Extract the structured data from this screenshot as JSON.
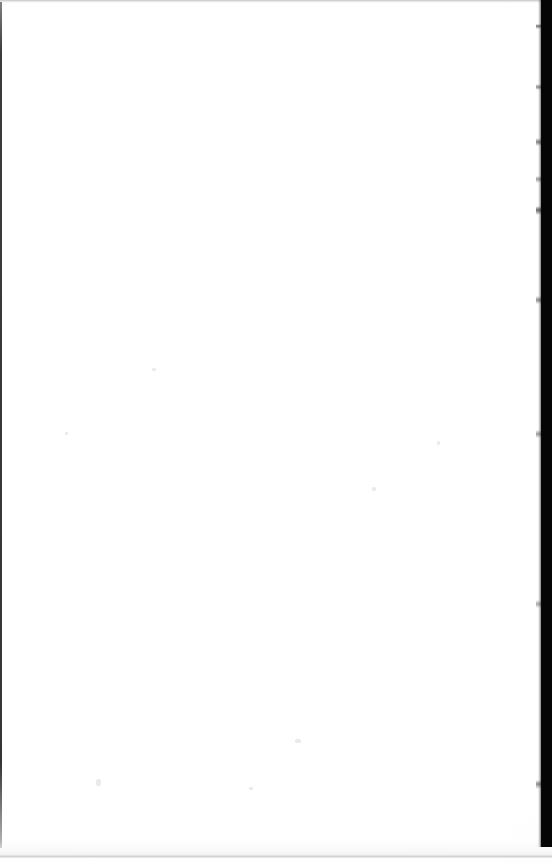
{
  "document": {
    "kind": "scanned-page",
    "page_content_text": "",
    "is_blank": true,
    "width_px": 552,
    "height_px": 863
  },
  "colors": {
    "page_background": "#fefefe",
    "scanner_bed": "#050505",
    "left_edge_line": "#191919",
    "top_edge_line": "#969696",
    "bottom_rule": "#a8a8a8",
    "speckle": "#e1e1e1"
  },
  "regions": {
    "page_surface": {
      "label": "page-surface",
      "x": 0,
      "y": 0,
      "width": 552,
      "height": 863
    },
    "content_area": {
      "label": "content-area",
      "x": 26,
      "y": 30,
      "width": 492,
      "height": 797
    },
    "scanner_bed_right": {
      "label": "scanner-bed-right-strip",
      "x": 541,
      "y": 0,
      "width": 11,
      "height": 847
    },
    "left_edge": {
      "label": "page-edge-left",
      "x": 0,
      "y": 2,
      "width": 2,
      "height": 846
    },
    "top_edge": {
      "label": "page-edge-top",
      "x": 0,
      "y": 0,
      "width": 552,
      "height": 3
    },
    "bottom_rule": {
      "label": "page-edge-bottom",
      "x": 0,
      "y": 855,
      "width": 552,
      "height": 3
    }
  },
  "speckles": [
    {
      "x": 96,
      "y": 779,
      "w": 5,
      "h": 7
    },
    {
      "x": 295,
      "y": 739,
      "w": 6,
      "h": 4
    },
    {
      "x": 249,
      "y": 787,
      "w": 4,
      "h": 3
    },
    {
      "x": 372,
      "y": 487,
      "w": 4,
      "h": 4
    },
    {
      "x": 152,
      "y": 368,
      "w": 4,
      "h": 3
    },
    {
      "x": 65,
      "y": 432,
      "w": 3,
      "h": 3
    },
    {
      "x": 437,
      "y": 441,
      "w": 3,
      "h": 4
    }
  ]
}
